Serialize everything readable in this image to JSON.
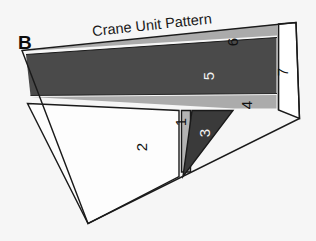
{
  "figure": {
    "panel_letter": "B",
    "title": "Crane Unit Pattern",
    "background_color": "#f6f6f6",
    "outline_color": "#1a1a1a"
  },
  "regions": [
    {
      "id": "region-1",
      "label": "1",
      "fill": "#b3b3b3",
      "label_color": "#111111",
      "points": "181.5,110.5 190.5,110.5 190.5,172.0 181.5,172.0",
      "label_x": 186,
      "label_y": 122
    },
    {
      "id": "region-2",
      "label": "2",
      "fill": "#fdfdfd",
      "label_color": "#111111",
      "points": "27.5,103.5 179.0,110.5 179.0,176.5 88.0,223.5",
      "label_x": 147,
      "label_y": 147
    },
    {
      "id": "region-3",
      "label": "3",
      "fill": "#3a3a3a",
      "label_color": "#f2f2f2",
      "points": "192.0,110.5 233.0,110.5 183.0,176.5",
      "label_x": 210,
      "label_y": 133
    },
    {
      "id": "region-4",
      "label": "4",
      "fill": "#ababab",
      "label_color": "#111111",
      "points": "31.0,97.0 276.5,95.0 276.5,108.5 234.5,108.5",
      "label_x": 252,
      "label_y": 105
    },
    {
      "id": "region-5",
      "label": "5",
      "fill": "#4a4a4a",
      "label_color": "#f2f2f2",
      "points": "26.0,54.5 276.5,37.5 276.5,93.5 30.5,95.5",
      "label_x": 214,
      "label_y": 76
    },
    {
      "id": "region-6",
      "label": "6",
      "fill": "#ababab",
      "label_color": "#111111",
      "points": "25.0,51.0 277.0,24.0 277.0,35.5",
      "label_x": 238,
      "label_y": 42
    },
    {
      "id": "region-7",
      "label": "7",
      "fill": "#ffffff",
      "label_color": "#111111",
      "points": "278.5,24.0 296.0,22.5 299.5,118.5 278.5,110.0",
      "label_x": 288,
      "label_y": 72
    }
  ],
  "outline": {
    "points": "22.0,50.5 296.0,22.5 299.5,118.5 88.0,223.5"
  },
  "title_transform": "rotate(-6.2, 150, 26)",
  "title_x": 92,
  "title_y": 30,
  "panel_letter_x": 18,
  "panel_letter_y": 49
}
